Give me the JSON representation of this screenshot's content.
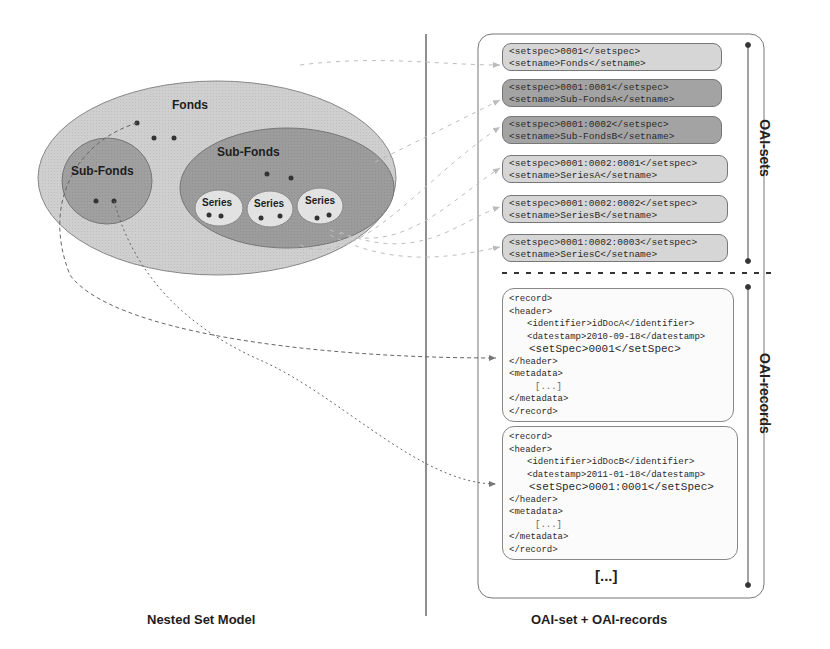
{
  "left_panel": {
    "caption": "Nested Set Model",
    "fonds_label": "Fonds",
    "subfonds_left_label": "Sub-Fonds",
    "subfonds_right_label": "Sub-Fonds",
    "series_labels": [
      "Series",
      "Series",
      "Series"
    ]
  },
  "right_panel": {
    "caption": "OAI-set + OAI-records",
    "sets_label": "OAI-sets",
    "records_label": "OAI-records",
    "more_indicator": "[...]",
    "sets": [
      {
        "spec_line": "<setspec>0001</setspec>",
        "name_line": "<setname>Fonds</setname>",
        "shade": "light"
      },
      {
        "spec_line": "<setspec>0001:0001</setspec>",
        "name_line": "<setname>Sub-FondsA</setname>",
        "shade": "dark"
      },
      {
        "spec_line": "<setspec>0001:0002</setspec>",
        "name_line": "<setname>Sub-FondsB</setname>",
        "shade": "dark"
      },
      {
        "spec_line": "<setspec>0001:0002:0001</setspec>",
        "name_line": "<setname>SeriesA</setname>",
        "shade": "light"
      },
      {
        "spec_line": "<setspec>0001:0002:0002</setspec>",
        "name_line": "<setname>SeriesB</setname>",
        "shade": "light"
      },
      {
        "spec_line": "<setspec>0001:0002:0003</setspec>",
        "name_line": "<setname>SeriesC</setname>",
        "shade": "light"
      }
    ],
    "records": [
      {
        "record_open": "<record>",
        "header_open": "<header>",
        "identifier": "<identifier>idDocA</identifier>",
        "datestamp": "<datestamp>2010-09-18</datestamp>",
        "setspec": "<setSpec>0001</setSpec>",
        "header_close": "</header>",
        "metadata_open": "<metadata>",
        "metadata_body": "[...]",
        "metadata_close": "</metadata>",
        "record_close": "</record>"
      },
      {
        "record_open": "<record>",
        "header_open": "<header>",
        "identifier": "<identifier>idDocB</identifier>",
        "datestamp": "<datestamp>2011-01-18</datestamp>",
        "setspec": "<setSpec>0001:0001</setSpec>",
        "header_close": "</header>",
        "metadata_open": "<metadata>",
        "metadata_body": "[...]",
        "metadata_close": "</metadata>",
        "record_close": "</record>"
      }
    ]
  },
  "colors": {
    "fonds_fill": "#cfcfcf",
    "subfonds_fill": "#9c9c9c",
    "series_fill": "#e2e2e2",
    "set_light": "#d6d6d6",
    "set_dark": "#a3a3a3",
    "line": "#555555"
  }
}
